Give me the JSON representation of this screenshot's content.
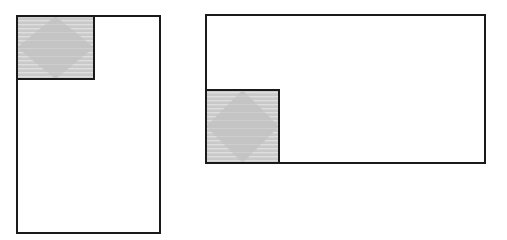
{
  "figure": {
    "background_color": "#ffffff",
    "stroke_color": "#1a1a1a",
    "stroke_width": 2,
    "shaded_fill_color": "#c9c9c9",
    "hatch_line_color": "#dcdcdc",
    "diamond_fill_color": "#c4c4c4"
  },
  "shapes": {
    "left": {
      "name": "tall-rectangle",
      "outer": {
        "x": 17,
        "y": 16,
        "width": 143,
        "height": 217
      },
      "shaded_square": {
        "x": 17,
        "y": 16,
        "width": 77,
        "height": 63
      },
      "diamond_corner_position": "top-left",
      "diamond": {
        "cx": 55.5,
        "cy": 47.5,
        "rx": 33,
        "ry": 27
      }
    },
    "right": {
      "name": "wide-rectangle",
      "outer": {
        "x": 206,
        "y": 15,
        "width": 279,
        "height": 148
      },
      "shaded_square": {
        "x": 206,
        "y": 90,
        "width": 73,
        "height": 73
      },
      "diamond_corner_position": "bottom-left",
      "diamond": {
        "cx": 242.5,
        "cy": 126.5,
        "rx": 32,
        "ry": 32
      }
    }
  }
}
